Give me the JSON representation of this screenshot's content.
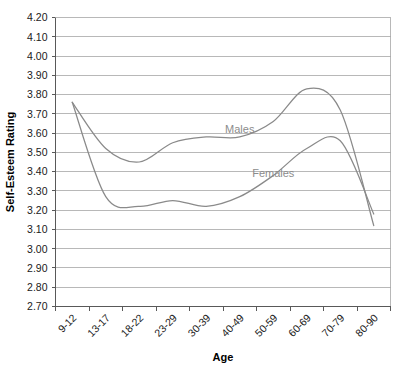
{
  "chart_data": {
    "type": "line",
    "title": "",
    "xlabel": "Age",
    "ylabel": "Self-Esteem Rating",
    "ylim": [
      2.7,
      4.2
    ],
    "ytick_step": 0.1,
    "grid": true,
    "legend_position": "inline-labels",
    "categories": [
      "9-12",
      "13-17",
      "18-22",
      "23-29",
      "30-39",
      "40-49",
      "50-59",
      "60-69",
      "70-79",
      "80-90"
    ],
    "ytick_labels": [
      "4.20",
      "4.10",
      "4.00",
      "3.90",
      "3.80",
      "3.70",
      "3.60",
      "3.50",
      "3.40",
      "3.30",
      "3.20",
      "3.10",
      "3.00",
      "2.90",
      "2.80",
      "2.70"
    ],
    "series": [
      {
        "name": "Males",
        "color": "#8a8a8a",
        "values": [
          3.76,
          3.52,
          3.45,
          3.55,
          3.58,
          3.58,
          3.66,
          3.83,
          3.72,
          3.12
        ]
      },
      {
        "name": "Females",
        "color": "#8a8a8a",
        "values": [
          3.76,
          3.27,
          3.22,
          3.25,
          3.22,
          3.27,
          3.38,
          3.52,
          3.56,
          3.18
        ]
      }
    ],
    "annotations": [
      {
        "text": "Males",
        "category": "40-49",
        "value": 3.6
      },
      {
        "text": "Females",
        "category": "50-59",
        "value": 3.37
      }
    ]
  },
  "axes": {
    "x_title": "Age",
    "y_title": "Self-Esteem Rating"
  }
}
